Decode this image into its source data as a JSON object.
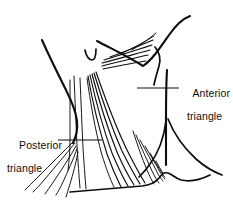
{
  "figure": {
    "background_color": "#ffffff",
    "ink_color": "#0d0d0d",
    "width": 233,
    "height": 208
  },
  "labels": {
    "anterior": {
      "line1": "Anterior",
      "line2": "triangle",
      "leader": "horizontal-leader-left"
    },
    "posterior": {
      "line1": "Posterior",
      "line2": "triangle",
      "leader": "horizontal-leader-right"
    }
  },
  "structures": [
    {
      "name": "mandible-lower-border",
      "type": "contour"
    },
    {
      "name": "jaw-angle-ascending-ramus",
      "type": "contour"
    },
    {
      "name": "left-neck-anterior-contour",
      "type": "contour"
    },
    {
      "name": "right-neck-posterior-contour",
      "type": "contour"
    },
    {
      "name": "clavicle-outline",
      "type": "contour"
    },
    {
      "name": "thyroid-notch-mark",
      "type": "landmark"
    },
    {
      "name": "sternocleidomastoid-fibers",
      "type": "muscle-fiber-bundle",
      "count": 6
    },
    {
      "name": "submandibular-fiber-bundle",
      "type": "muscle-fiber-bundle",
      "count": 5
    },
    {
      "name": "trapezius-fiber-fan",
      "type": "muscle-fiber-bundle",
      "count": 6
    },
    {
      "name": "supraclavicular-fiber-fan",
      "type": "muscle-fiber-bundle",
      "count": 6
    },
    {
      "name": "median-vertical-fibers",
      "type": "muscle-fiber-bundle",
      "count": 3
    }
  ]
}
